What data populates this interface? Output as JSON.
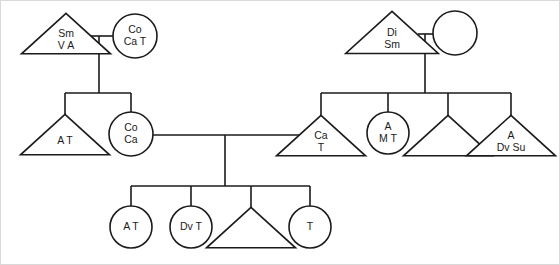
{
  "diagram": {
    "type": "family-genogram",
    "canvas": {
      "width": 560,
      "height": 265
    },
    "style": {
      "line_color": "#1b1b1b",
      "shape_fill": "#ffffff",
      "background": "#ffffff",
      "frame_color": "#d9d9d9",
      "line_width": 1.6
    },
    "legend_note": "",
    "symbols": {
      "triangle": "male-or-person-triangle",
      "circle": "female-or-person-circle"
    }
  },
  "nodes": [
    {
      "id": "g1-left-triangle",
      "name": "node-triangle-sm-v-a",
      "shape": "triangle",
      "cx": 66,
      "cy": 36,
      "size": 25,
      "lines": [
        "Sm",
        "V A"
      ],
      "label": "Sm\nV A",
      "generation": 1
    },
    {
      "id": "g1-left-circle",
      "name": "node-circle-co-ca-t",
      "shape": "circle",
      "cx": 135,
      "cy": 36,
      "size": 22,
      "lines": [
        "Co",
        "Ca T"
      ],
      "label": "Co\nCa T",
      "generation": 1
    },
    {
      "id": "g1-right-triangle",
      "name": "node-triangle-di-sm",
      "shape": "triangle",
      "cx": 392,
      "cy": 35,
      "size": 26,
      "lines": [
        "Di",
        "Sm"
      ],
      "label": "Di\nSm",
      "generation": 1
    },
    {
      "id": "g1-right-circle",
      "name": "node-circle-empty-top-right",
      "shape": "circle",
      "cx": 455,
      "cy": 33,
      "size": 22,
      "lines": [],
      "label": "",
      "generation": 1
    },
    {
      "id": "g2-a-t",
      "name": "node-triangle-a-t",
      "shape": "triangle",
      "cx": 65,
      "cy": 137,
      "size": 25,
      "lines": [
        "A T"
      ],
      "label": "A T",
      "generation": 2
    },
    {
      "id": "g2-co-ca",
      "name": "node-circle-co-ca",
      "shape": "circle",
      "cx": 131,
      "cy": 134,
      "size": 22,
      "lines": [
        "Co",
        "Ca"
      ],
      "label": "Co\nCa",
      "generation": 2
    },
    {
      "id": "g2-ca-t",
      "name": "node-triangle-ca-t",
      "shape": "triangle",
      "cx": 321,
      "cy": 138,
      "size": 25,
      "lines": [
        "Ca",
        "T"
      ],
      "label": "Ca\nT",
      "generation": 2
    },
    {
      "id": "g2-a-m-t",
      "name": "node-circle-a-m-t",
      "shape": "circle",
      "cx": 388,
      "cy": 133,
      "size": 21,
      "lines": [
        "A",
        "M T"
      ],
      "label": "A\nM T",
      "generation": 2
    },
    {
      "id": "g2-empty-triangle",
      "name": "node-triangle-empty-gen2",
      "shape": "triangle",
      "cx": 448,
      "cy": 138,
      "size": 25,
      "lines": [],
      "label": "",
      "generation": 2
    },
    {
      "id": "g2-a-dv-su",
      "name": "node-triangle-a-dv-su",
      "shape": "triangle",
      "cx": 511,
      "cy": 138,
      "size": 25,
      "lines": [
        "A",
        "Dv Su"
      ],
      "label": "A\nDv Su",
      "generation": 2
    },
    {
      "id": "g3-a-t",
      "name": "node-circle-a-t",
      "shape": "circle",
      "cx": 131,
      "cy": 227,
      "size": 21,
      "lines": [
        "A T"
      ],
      "label": "A T",
      "generation": 3
    },
    {
      "id": "g3-dv-t",
      "name": "node-circle-dv-t",
      "shape": "circle",
      "cx": 191,
      "cy": 227,
      "size": 21,
      "lines": [
        "Dv T"
      ],
      "label": "Dv T",
      "generation": 3
    },
    {
      "id": "g3-empty-triangle",
      "name": "node-triangle-empty-gen3",
      "shape": "triangle",
      "cx": 251,
      "cy": 230,
      "size": 25,
      "lines": [],
      "label": "",
      "generation": 3
    },
    {
      "id": "g3-t",
      "name": "node-circle-t",
      "shape": "circle",
      "cx": 310,
      "cy": 227,
      "size": 21,
      "lines": [
        "T"
      ],
      "label": "T",
      "generation": 3
    }
  ],
  "links": [
    {
      "name": "union-line-gen1-left",
      "points": "88,36 113,36"
    },
    {
      "name": "union-drop-gen1-left",
      "points": "99,36 99,93"
    },
    {
      "name": "sibship-bar-gen2-left",
      "points": "65,93 131,93"
    },
    {
      "name": "sibship-drop-a-t",
      "points": "65,93 65,119"
    },
    {
      "name": "sibship-drop-co-ca",
      "points": "131,93 131,112"
    },
    {
      "name": "union-line-gen1-right",
      "points": "418,34 433,34"
    },
    {
      "name": "union-drop-gen1-right",
      "points": "425,34 425,93"
    },
    {
      "name": "sibship-bar-gen2-right",
      "points": "321,93 511,93"
    },
    {
      "name": "sibship-drop-ca-t",
      "points": "321,93 321,120"
    },
    {
      "name": "sibship-drop-a-m-t",
      "points": "388,93 388,112"
    },
    {
      "name": "sibship-drop-empty-tri-gen2",
      "points": "448,93 448,120"
    },
    {
      "name": "sibship-drop-a-dv-su",
      "points": "511,93 511,120"
    },
    {
      "name": "union-line-gen2-center",
      "points": "153,135 299,135"
    },
    {
      "name": "union-drop-gen2-center",
      "points": "225,135 225,186"
    },
    {
      "name": "sibship-bar-gen3",
      "points": "131,186 310,186"
    },
    {
      "name": "sibship-drop-g3-a-t",
      "points": "131,186 131,206"
    },
    {
      "name": "sibship-drop-g3-dv-t",
      "points": "191,186 191,206"
    },
    {
      "name": "sibship-drop-g3-empty-tri",
      "points": "251,186 251,212"
    },
    {
      "name": "sibship-drop-g3-t",
      "points": "310,186 310,206"
    }
  ],
  "frame": {
    "name": "image-border",
    "x": 0.5,
    "y": 0.5,
    "width": 559,
    "height": 264
  }
}
